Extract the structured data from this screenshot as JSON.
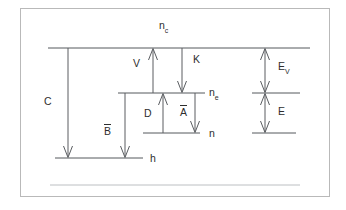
{
  "figure": {
    "kind": "energy-level-rate-diagram",
    "background_color": "#ffffff",
    "frame_color": "#b9b9b9",
    "line_color": "#55585c",
    "text_color": "#2e2e2e"
  },
  "labels": {
    "n_c": {
      "base": "n",
      "sub": "c"
    },
    "n_e": {
      "base": "n",
      "sub": "e"
    },
    "n": {
      "base": "n",
      "sub": ""
    },
    "h": {
      "base": "h",
      "sub": ""
    },
    "C": {
      "base": "C",
      "sub": ""
    },
    "V": {
      "base": "V",
      "sub": ""
    },
    "K": {
      "base": "K",
      "sub": ""
    },
    "D": {
      "base": "D",
      "sub": ""
    },
    "A_bar": {
      "base": "A",
      "sub": ""
    },
    "B_bar": {
      "base": "B",
      "sub": ""
    },
    "E_V": {
      "base": "E",
      "sub": "V"
    },
    "E": {
      "base": "E",
      "sub": ""
    }
  },
  "levels": [
    {
      "name": "top-level-nc",
      "label": "n_c",
      "y": 48,
      "x1": 48,
      "x2": 310
    },
    {
      "name": "mid-level-ne",
      "label": "n_e",
      "y": 93,
      "x1": 118,
      "x2": 205
    },
    {
      "name": "mid-level-right-tick",
      "label": "",
      "y": 93,
      "x1": 252,
      "x2": 300
    },
    {
      "name": "lower-level-n",
      "label": "n",
      "y": 133,
      "x1": 143,
      "x2": 200
    },
    {
      "name": "lower-level-right-tick",
      "label": "",
      "y": 133,
      "x1": 252,
      "x2": 296
    },
    {
      "name": "bottom-level-h",
      "label": "h",
      "y": 158,
      "x1": 55,
      "x2": 143
    },
    {
      "name": "baseline-faint",
      "label": "",
      "y": 185,
      "x1": 50,
      "x2": 300
    }
  ],
  "arrows": [
    {
      "name": "arrow-C",
      "label": "C",
      "x": 68,
      "y1": 48,
      "y2": 158,
      "heads": "down"
    },
    {
      "name": "arrow-B-bar",
      "label": "B_bar",
      "x": 125,
      "y1": 93,
      "y2": 158,
      "heads": "down"
    },
    {
      "name": "arrow-V",
      "label": "V",
      "x": 153,
      "y1": 93,
      "y2": 48,
      "heads": "up"
    },
    {
      "name": "arrow-K",
      "label": "K",
      "x": 182,
      "y1": 48,
      "y2": 93,
      "heads": "down"
    },
    {
      "name": "arrow-D",
      "label": "D",
      "x": 163,
      "y1": 133,
      "y2": 93,
      "heads": "up"
    },
    {
      "name": "arrow-A-bar",
      "label": "A_bar",
      "x": 195,
      "y1": 93,
      "y2": 133,
      "heads": "down"
    },
    {
      "name": "arrow-E-V",
      "label": "E_V",
      "x": 265,
      "y1": 48,
      "y2": 93,
      "heads": "both"
    },
    {
      "name": "arrow-E",
      "label": "E",
      "x": 265,
      "y1": 93,
      "y2": 133,
      "heads": "both"
    }
  ]
}
